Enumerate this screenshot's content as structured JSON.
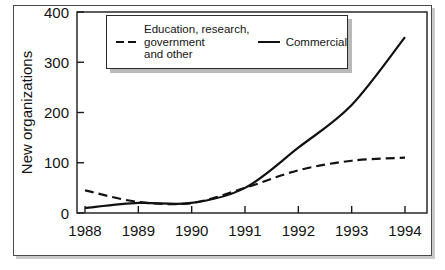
{
  "figure": {
    "frame": true,
    "background_color": "#ffffff",
    "line_color": "#111111"
  },
  "legend": {
    "position": "top-center",
    "entries": [
      {
        "label": "Education, research,\ngovernment\nand other",
        "style": "dashed",
        "swatch_name": "dashed-line-swatch"
      },
      {
        "label": "Commercial",
        "style": "solid",
        "swatch_name": "solid-line-swatch"
      }
    ]
  },
  "chart_data": {
    "type": "line",
    "title": "",
    "xlabel": "",
    "ylabel": "New organizations",
    "categories": [
      "1988",
      "1989",
      "1990",
      "1991",
      "1992",
      "1993",
      "1994"
    ],
    "x": [
      1988,
      1989,
      1990,
      1991,
      1992,
      1993,
      1994
    ],
    "xlim": [
      1988,
      1994
    ],
    "ylim": [
      0,
      400
    ],
    "yticks": [
      "0",
      "100",
      "200",
      "300",
      "400"
    ],
    "ytick_values": [
      0,
      100,
      200,
      300,
      400
    ],
    "xticks": [
      "1988",
      "1989",
      "1990",
      "1991",
      "1992",
      "1993",
      "1994"
    ],
    "grid": false,
    "legend_position": "top-center",
    "series": [
      {
        "name": "Education, research, government and other",
        "style": "dashed",
        "color": "#111111",
        "values": [
          45,
          22,
          20,
          50,
          85,
          104,
          110
        ]
      },
      {
        "name": "Commercial",
        "style": "solid",
        "color": "#111111",
        "values": [
          10,
          20,
          20,
          50,
          130,
          215,
          350
        ]
      }
    ]
  }
}
